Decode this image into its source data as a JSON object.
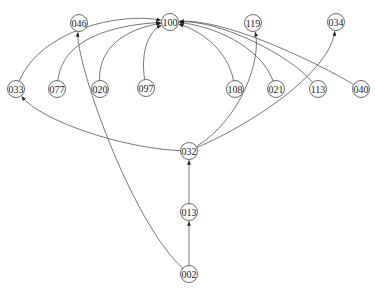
{
  "graph": {
    "type": "directed",
    "nodes": [
      {
        "id": "046",
        "label": "046"
      },
      {
        "id": "100",
        "label": "100"
      },
      {
        "id": "119",
        "label": "119"
      },
      {
        "id": "034",
        "label": "034"
      },
      {
        "id": "033",
        "label": "033"
      },
      {
        "id": "077",
        "label": "077"
      },
      {
        "id": "020",
        "label": "020"
      },
      {
        "id": "097",
        "label": "097"
      },
      {
        "id": "108",
        "label": "108"
      },
      {
        "id": "021",
        "label": "021"
      },
      {
        "id": "113",
        "label": "113"
      },
      {
        "id": "040",
        "label": "040"
      },
      {
        "id": "032",
        "label": "032"
      },
      {
        "id": "013",
        "label": "013"
      },
      {
        "id": "002",
        "label": "002"
      }
    ],
    "edges": [
      {
        "from": "033",
        "to": "100"
      },
      {
        "from": "077",
        "to": "100"
      },
      {
        "from": "020",
        "to": "100"
      },
      {
        "from": "097",
        "to": "100"
      },
      {
        "from": "108",
        "to": "100"
      },
      {
        "from": "021",
        "to": "100"
      },
      {
        "from": "113",
        "to": "100"
      },
      {
        "from": "040",
        "to": "100"
      },
      {
        "from": "032",
        "to": "033"
      },
      {
        "from": "032",
        "to": "119"
      },
      {
        "from": "032",
        "to": "034"
      },
      {
        "from": "013",
        "to": "032"
      },
      {
        "from": "002",
        "to": "013"
      },
      {
        "from": "002",
        "to": "046"
      }
    ]
  }
}
